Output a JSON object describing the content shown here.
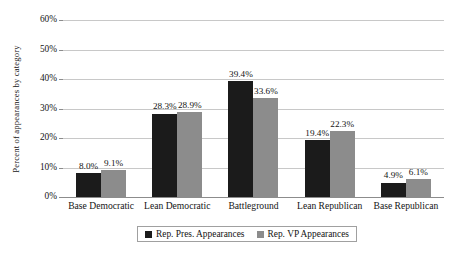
{
  "title_remnant": "",
  "chart_data": {
    "type": "bar",
    "title": "",
    "subtitle": "",
    "xlabel": "",
    "ylabel": "Percent of appearances by category",
    "ylim": [
      0,
      60
    ],
    "ytick_labels": [
      "60%",
      "50%",
      "40%",
      "30%",
      "20%",
      "10%",
      "0%"
    ],
    "ytick_values": [
      60,
      50,
      40,
      30,
      20,
      10,
      0
    ],
    "grid": true,
    "legend_position": "bottom-center",
    "categories": [
      "Base Democratic",
      "Lean Democratic",
      "Battleground",
      "Lean Republican",
      "Base Republican"
    ],
    "series": [
      {
        "name": "Rep. Pres. Appearances",
        "color": "#1b1b1b",
        "values": [
          8.0,
          28.3,
          39.4,
          19.4,
          4.9
        ],
        "labels": [
          "8.0%",
          "28.3%",
          "39.4%",
          "19.4%",
          "4.9%"
        ]
      },
      {
        "name": "Rep. VP Appearances",
        "color": "#8c8c8c",
        "values": [
          9.1,
          28.9,
          33.6,
          22.3,
          6.1
        ],
        "labels": [
          "9.1%",
          "28.9%",
          "33.6%",
          "22.3%",
          "6.1%"
        ]
      }
    ]
  }
}
